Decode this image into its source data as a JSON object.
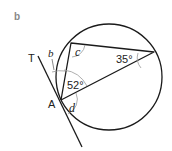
{
  "part_label": "b",
  "points": {
    "tangent_label": "T",
    "point_label": "A"
  },
  "angles": {
    "b": "b",
    "c": "c",
    "d": "d",
    "a52": "52°",
    "a35": "35°"
  },
  "colors": {
    "stroke": "#1a1a1a",
    "arc": "#999999",
    "part_label": "#888888"
  }
}
